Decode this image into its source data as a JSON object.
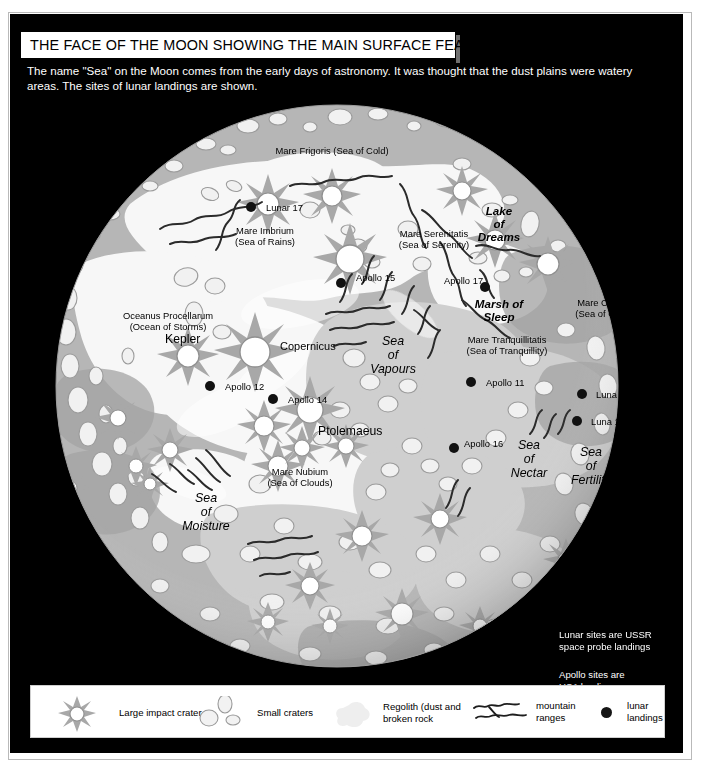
{
  "title": "THE FACE OF THE MOON SHOWING THE MAIN SURFACE FEATURES",
  "subtitle": "The name \"Sea\" on the Moon comes from the early days of astronomy. It was thought that the dust plains were watery areas. The sites of lunar landings are shown.",
  "map": {
    "features": [
      {
        "name": "mare-frigoris",
        "text": "Mare Frigoris (Sea of Cold)",
        "x": 322,
        "y": 131,
        "style": "ctr"
      },
      {
        "name": "mare-imbrium",
        "text": "Mare Imbrium\n(Sea of Rains)",
        "x": 255,
        "y": 211,
        "style": "ctr"
      },
      {
        "name": "mare-serenitatis",
        "text": "Mare Serenitatis\n(Sea of Serenity)",
        "x": 424,
        "y": 214,
        "style": "ctr"
      },
      {
        "name": "lake-of-dreams",
        "text": "Lake\nof\nDreams",
        "x": 489,
        "y": 190,
        "style": "dream"
      },
      {
        "name": "mare-crisium",
        "text": "Mare Crisium\n(Sea of Crisis)",
        "x": 595,
        "y": 283,
        "style": "ctr"
      },
      {
        "name": "marsh-of-sleep",
        "text": "Marsh of\nSleep",
        "x": 489,
        "y": 283,
        "style": "marsh"
      },
      {
        "name": "mare-tranquillitatis",
        "text": "Mare Tranquillitatis\n(Sea of Tranquillity)",
        "x": 497,
        "y": 320,
        "style": "ctr"
      },
      {
        "name": "oceanus-procellarum",
        "text": "Oceanus Procellarum\n(Ocean of Storms)",
        "x": 158,
        "y": 296,
        "style": "ctr"
      },
      {
        "name": "kepler",
        "text": "Kepler",
        "x": 155,
        "y": 320,
        "style": "big"
      },
      {
        "name": "copernicus",
        "text": "Copernicus",
        "x": 270,
        "y": 327,
        "style": "mid"
      },
      {
        "name": "sea-of-vapours",
        "text": "Sea\nof\nVapours",
        "x": 383,
        "y": 320,
        "style": "seas"
      },
      {
        "name": "ptolemaeus",
        "text": "Ptolemaeus",
        "x": 308,
        "y": 412,
        "style": "big"
      },
      {
        "name": "mare-nubium",
        "text": "Mare Nubium\n(Sea of Clouds)",
        "x": 290,
        "y": 452,
        "style": "ctr"
      },
      {
        "name": "sea-of-moisture",
        "text": "Sea\nof\nMoisture",
        "x": 196,
        "y": 477,
        "style": "seas"
      },
      {
        "name": "sea-of-nectar",
        "text": "Sea\nof\nNectar",
        "x": 519,
        "y": 424,
        "style": "seas"
      },
      {
        "name": "sea-of-fertility",
        "text": "Sea\nof\nFertility",
        "x": 581,
        "y": 431,
        "style": "seas"
      }
    ],
    "landings": [
      {
        "name": "lunar-17",
        "label": "Lunar 17",
        "dot_x": 241,
        "dot_y": 193,
        "lx": 256,
        "ly": 188
      },
      {
        "name": "apollo-15",
        "label": "Apollo 15",
        "dot_x": 331,
        "dot_y": 269,
        "lx": 346,
        "ly": 258
      },
      {
        "name": "apollo-17",
        "label": "Apollo 17",
        "dot_x": 475,
        "dot_y": 273,
        "lx": 434,
        "ly": 261
      },
      {
        "name": "apollo-12",
        "label": "Apollo 12",
        "dot_x": 200,
        "dot_y": 372,
        "lx": 215,
        "ly": 367
      },
      {
        "name": "apollo-14",
        "label": "Apollo 14",
        "dot_x": 263,
        "dot_y": 385,
        "lx": 278,
        "ly": 380
      },
      {
        "name": "apollo-11",
        "label": "Apollo 11",
        "dot_x": 461,
        "dot_y": 368,
        "lx": 476,
        "ly": 363
      },
      {
        "name": "luna-20",
        "label": "Luna 20",
        "dot_x": 572,
        "dot_y": 380,
        "lx": 586,
        "ly": 375
      },
      {
        "name": "luna-16",
        "label": "Luna 16",
        "dot_x": 567,
        "dot_y": 407,
        "lx": 581,
        "ly": 402
      },
      {
        "name": "apollo-16",
        "label": "Apollo 16",
        "dot_x": 444,
        "dot_y": 434,
        "lx": 454,
        "ly": 424
      }
    ],
    "notes": [
      {
        "name": "note-lunar",
        "text": "Lunar sites are USSR\nspace probe landings",
        "x": 549,
        "y": 615
      },
      {
        "name": "note-apollo",
        "text": "Apollo sites are\nUSA landings",
        "x": 549,
        "y": 655
      }
    ]
  },
  "legend": {
    "items": [
      {
        "name": "large-impact-crater",
        "label": "Large impact crater",
        "icon": "star-crater-icon"
      },
      {
        "name": "small-craters",
        "label": "Small craters",
        "icon": "small-craters-icon"
      },
      {
        "name": "regolith",
        "label": "Regolith (dust and\nbroken rock",
        "icon": "regolith-blob-icon"
      },
      {
        "name": "mountain-ranges",
        "label": "mountain\nranges",
        "icon": "mountain-squiggle-icon"
      },
      {
        "name": "lunar-landings",
        "label": "lunar\nlandings",
        "icon": "landing-dot-icon"
      }
    ]
  },
  "colors": {
    "background": "#000000",
    "page": "#ffffff",
    "highland": "#b4b4b4",
    "mare_light": "#f4f4f4",
    "mare_mid": "#d8d8d8",
    "crater_fill": "#f0f0f0",
    "crater_stroke": "#9a9a9a",
    "dot": "#111111",
    "text_on_black": "#ffffff",
    "text_on_map": "#000000"
  }
}
